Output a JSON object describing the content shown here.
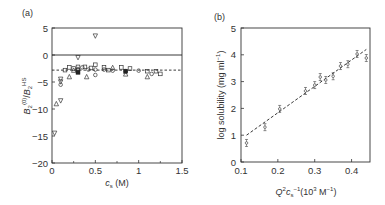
{
  "chart_data": [
    {
      "panel": "(a)",
      "type": "scatter",
      "xlabel": "c_s (M)",
      "ylabel": "B2(0)/B2HS",
      "xlim": [
        0,
        1.5
      ],
      "ylim": [
        -20,
        5
      ],
      "xticks": [
        "0",
        "0.5",
        "1",
        "1.5"
      ],
      "yticks": [
        "5",
        "0",
        "-5",
        "-10",
        "-15",
        "-20"
      ],
      "reference_lines": [
        {
          "type": "solid",
          "y": 0
        },
        {
          "type": "dashed",
          "y": -2.8
        }
      ],
      "series": [
        {
          "name": "down-triangle",
          "marker": "▽",
          "points": [
            [
              0.03,
              -14.5
            ],
            [
              0.1,
              -8.5
            ],
            [
              0.3,
              -0.5
            ],
            [
              0.5,
              3.5
            ],
            [
              0.1,
              -4.5
            ],
            [
              0.1,
              -5.0
            ],
            [
              0.3,
              -3.0
            ]
          ]
        },
        {
          "name": "up-triangle",
          "marker": "△",
          "points": [
            [
              0.05,
              -9.0
            ],
            [
              0.2,
              -4.0
            ],
            [
              0.4,
              -4.0
            ],
            [
              0.7,
              -2.3
            ],
            [
              1.1,
              -4.0
            ],
            [
              0.25,
              -2.8
            ],
            [
              0.85,
              -3.5
            ]
          ]
        },
        {
          "name": "circle",
          "marker": "○",
          "points": [
            [
              0.1,
              -5.5
            ],
            [
              0.35,
              -2.3
            ],
            [
              0.42,
              -2.7
            ],
            [
              0.5,
              -3.7
            ],
            [
              0.5,
              -2.7
            ],
            [
              0.6,
              -2.7
            ],
            [
              0.7,
              -2.9
            ],
            [
              0.85,
              -3.0
            ],
            [
              1.0,
              -2.9
            ],
            [
              1.15,
              -3.5
            ],
            [
              0.3,
              -2.6
            ]
          ]
        },
        {
          "name": "square",
          "marker": "□",
          "points": [
            [
              0.2,
              -2.3
            ],
            [
              0.25,
              -2.5
            ],
            [
              0.3,
              -2.2
            ],
            [
              0.38,
              -2.2
            ],
            [
              0.45,
              -2.4
            ],
            [
              0.5,
              -1.8
            ],
            [
              0.6,
              -2.3
            ],
            [
              0.65,
              -2.8
            ],
            [
              0.8,
              -2.3
            ],
            [
              0.9,
              -2.5
            ],
            [
              1.1,
              -3.0
            ],
            [
              1.2,
              -3.0
            ],
            [
              1.25,
              -3.5
            ],
            [
              0.15,
              -2.8
            ]
          ]
        },
        {
          "name": "filled",
          "marker": "■",
          "points": [
            [
              0.3,
              -3.2
            ],
            [
              0.85,
              -3.0
            ]
          ]
        }
      ]
    },
    {
      "panel": "(b)",
      "type": "scatter",
      "xlabel": "Q²c_s⁻¹(10³ M⁻¹)",
      "ylabel": "log solubility (mg ml⁻¹)",
      "xlim": [
        0.1,
        0.45
      ],
      "ylim": [
        0,
        5
      ],
      "xticks": [
        "0.1",
        "0.2",
        "0.3",
        "0.4"
      ],
      "yticks": [
        "0",
        "1",
        "2",
        "3",
        "4",
        "5"
      ],
      "x": [
        0.115,
        0.165,
        0.205,
        0.275,
        0.3,
        0.315,
        0.33,
        0.35,
        0.37,
        0.39,
        0.415,
        0.44
      ],
      "values": [
        0.71,
        1.3,
        1.98,
        2.65,
        2.87,
        3.17,
        3.06,
        3.2,
        3.58,
        3.65,
        4.03,
        3.88
      ],
      "fit_line": {
        "style": "dashed",
        "x": [
          0.115,
          0.44
        ],
        "y": [
          1.0,
          4.2
        ]
      }
    }
  ],
  "panels": {
    "a": {
      "label": "(a)",
      "xlabel_main": "c",
      "xlabel_sub": "s",
      "xlabel_unit": " (M)",
      "ylabel_B": "B",
      "ylabel_sub": "2",
      "ylabel_sup": "(0)",
      "ylabel_slash": "/",
      "ylabel_sup2": "HS"
    },
    "b": {
      "label": "(b)",
      "ylabel": "log solubility (mg ml",
      "ylabel_sup": "−1",
      "ylabel_end": ")",
      "xlabel_Q": "Q",
      "xlabel_sup2": "2",
      "xlabel_c": "c",
      "xlabel_sub": "s",
      "xlabel_sup": "−1",
      "xlabel_unit": "(10",
      "xlabel_sup3": "3",
      "xlabel_unit2": " M",
      "xlabel_sup4": "−1",
      "xlabel_end": ")"
    }
  }
}
